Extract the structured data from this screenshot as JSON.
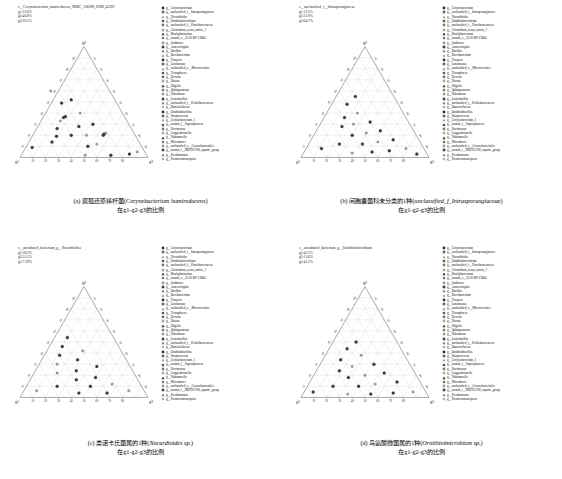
{
  "figure": {
    "axis_labels": {
      "top": "g2",
      "left": "g1",
      "right": "g3"
    },
    "ticks": [
      10,
      20,
      30,
      40,
      50,
      60,
      70,
      80,
      90
    ],
    "grid": true
  },
  "genera": [
    "g__Corynebacterium",
    "g__unclassified_f__Intrasporangiaceae",
    "g__Nocardioides",
    "g__Ornithinimicrobium",
    "g__unclassified_f__Flavobacteriaceae",
    "g__Clostridium_sensu_stricto_1",
    "g__Brachybacterium",
    "g__norank_o__JG30-KF-CM45",
    "g__Janibacter",
    "g__Anaerovirgula",
    "g__Bacillus",
    "g__Brevibacterium",
    "g__Truepera",
    "g__Luteimonas",
    "g__unclassified_o__Micrococcales",
    "g__Tetrasphaera",
    "g__Devosia",
    "g__Dietzia",
    "g__Oligella",
    "g__Sphingomonas",
    "g__Halomonas",
    "g__Lactobacillus",
    "g__unclassified_f__Prolixibacteraceae",
    "g__Barnesiellaceae",
    "g__Ornithinibacillus",
    "g__Streptococcus",
    "g__Corynebacterium_1",
    "g__norank_f__Saprospiraceae",
    "g__Parvimonas",
    "g__Guggenheimella",
    "g__Nakamurella",
    "g__Microbacter",
    "g__unclassified_o__Corynebacteriales",
    "g__norank_f__MBTI33-80_aquatic_group",
    "g__Pseudomonas",
    "g__Promicromonospora"
  ],
  "panels": [
    {
      "id": "a",
      "species_label": "s__Corynebacterium_humireducens_NBRC_106098_DSM_45392",
      "stats": [
        "g1:32.6%",
        "g2:46.8%",
        "g3:20.5%"
      ],
      "caption_cn": "(a) 腐殖还原棒杆菌(",
      "caption_sp": "Corynebacterium humireducens",
      "caption_tail": ")",
      "caption_line2": "在g1-g2-g3的比例",
      "points": [
        {
          "g1": 34,
          "g2": 52,
          "g3": 14
        },
        {
          "g1": 43,
          "g2": 49,
          "g3": 8
        },
        {
          "g1": 33,
          "g2": 40,
          "g3": 27
        },
        {
          "g1": 46,
          "g2": 37,
          "g3": 17
        },
        {
          "g1": 48,
          "g2": 36,
          "g3": 16
        },
        {
          "g1": 52,
          "g2": 33,
          "g3": 15
        },
        {
          "g1": 28,
          "g2": 30,
          "g3": 42
        },
        {
          "g1": 40,
          "g2": 28,
          "g3": 32
        },
        {
          "g1": 22,
          "g2": 22,
          "g3": 56
        },
        {
          "g1": 24,
          "g2": 21,
          "g3": 55
        },
        {
          "g1": 25,
          "g2": 20,
          "g3": 55
        },
        {
          "g1": 38,
          "g2": 20,
          "g3": 42
        },
        {
          "g1": 50,
          "g2": 20,
          "g3": 30
        },
        {
          "g1": 62,
          "g2": 19,
          "g3": 19
        },
        {
          "g1": 34,
          "g2": 12,
          "g3": 54
        },
        {
          "g1": 42,
          "g2": 10,
          "g3": 48
        },
        {
          "g1": 86,
          "g2": 9,
          "g3": 5
        },
        {
          "g1": 6,
          "g2": 5,
          "g3": 89
        },
        {
          "g1": 13,
          "g2": 3,
          "g3": 84
        },
        {
          "g1": 28,
          "g2": 2,
          "g3": 70
        },
        {
          "g1": 48,
          "g2": 2,
          "g3": 50
        },
        {
          "g1": 68,
          "g2": 14,
          "g3": 18
        },
        {
          "g1": 58,
          "g2": 26,
          "g3": 16
        },
        {
          "g1": 46,
          "g2": 60,
          "g3": -6
        }
      ]
    },
    {
      "id": "b",
      "species_label": "s__unclassified_f__Intrasporangiaceae",
      "stats": [
        "g1:13.5%",
        "g2:21.8%",
        "g3:64.7%"
      ],
      "caption_cn": "(b) 间胞囊菌科未分类的1种(",
      "caption_sp": "unclassified_f_Intrasporangiaceae",
      "caption_tail": ")",
      "caption_line2": "在g1-g2-g3的比例",
      "points": [
        {
          "g1": 30,
          "g2": 55,
          "g3": 15
        },
        {
          "g1": 40,
          "g2": 48,
          "g3": 12
        },
        {
          "g1": 36,
          "g2": 40,
          "g3": 24
        },
        {
          "g1": 48,
          "g2": 36,
          "g3": 16
        },
        {
          "g1": 30,
          "g2": 32,
          "g3": 38
        },
        {
          "g1": 44,
          "g2": 30,
          "g3": 26
        },
        {
          "g1": 54,
          "g2": 28,
          "g3": 18
        },
        {
          "g1": 26,
          "g2": 24,
          "g3": 50
        },
        {
          "g1": 38,
          "g2": 22,
          "g3": 40
        },
        {
          "g1": 50,
          "g2": 20,
          "g3": 30
        },
        {
          "g1": 20,
          "g2": 16,
          "g3": 64
        },
        {
          "g1": 33,
          "g2": 14,
          "g3": 53
        },
        {
          "g1": 46,
          "g2": 12,
          "g3": 42
        },
        {
          "g1": 64,
          "g2": 12,
          "g3": 24
        },
        {
          "g1": 14,
          "g2": 8,
          "g3": 78
        },
        {
          "g1": 28,
          "g2": 6,
          "g3": 66
        },
        {
          "g1": 42,
          "g2": 5,
          "g3": 53
        },
        {
          "g1": 58,
          "g2": 4,
          "g3": 38
        },
        {
          "g1": 80,
          "g2": 8,
          "g3": 12
        },
        {
          "g1": 8,
          "g2": 3,
          "g3": 89
        }
      ]
    },
    {
      "id": "c",
      "species_label": "s__uncultured_bacterium_g__Nocardioides",
      "stats": [
        "g1:38.3%",
        "g2:53.1%",
        "g3:7.59%"
      ],
      "caption_cn": "(c) 类诺卡氏菌属的1种(",
      "caption_sp": "Nocardioides sp.",
      "caption_tail": ")",
      "caption_line2": "在g1-g2-g3的比例",
      "points": [
        {
          "g1": 36,
          "g2": 54,
          "g3": 10
        },
        {
          "g1": 44,
          "g2": 46,
          "g3": 10
        },
        {
          "g1": 30,
          "g2": 42,
          "g3": 28
        },
        {
          "g1": 50,
          "g2": 38,
          "g3": 12
        },
        {
          "g1": 38,
          "g2": 34,
          "g3": 28
        },
        {
          "g1": 56,
          "g2": 30,
          "g3": 14
        },
        {
          "g1": 26,
          "g2": 28,
          "g3": 46
        },
        {
          "g1": 44,
          "g2": 24,
          "g3": 32
        },
        {
          "g1": 60,
          "g2": 22,
          "g3": 18
        },
        {
          "g1": 32,
          "g2": 18,
          "g3": 50
        },
        {
          "g1": 48,
          "g2": 16,
          "g3": 36
        },
        {
          "g1": 22,
          "g2": 12,
          "g3": 66
        },
        {
          "g1": 40,
          "g2": 10,
          "g3": 50
        },
        {
          "g1": 66,
          "g2": 10,
          "g3": 24
        },
        {
          "g1": 12,
          "g2": 6,
          "g3": 82
        },
        {
          "g1": 30,
          "g2": 4,
          "g3": 66
        },
        {
          "g1": 52,
          "g2": 4,
          "g3": 44
        },
        {
          "g1": 84,
          "g2": 6,
          "g3": 10
        }
      ]
    },
    {
      "id": "d",
      "species_label": "s__uncultured_bacterium_g__Ornithinimicrobium",
      "stats": [
        "g1:43.2%",
        "g2:15.6%",
        "g3:41.2%"
      ],
      "caption_cn": "(d) 鸟氨酸微菌属的1种(",
      "caption_sp": "Ornithinimicrobium sp.",
      "caption_tail": ")",
      "caption_line2": "在g1-g2-g3的比例",
      "points": [
        {
          "g1": 32,
          "g2": 50,
          "g3": 18
        },
        {
          "g1": 42,
          "g2": 44,
          "g3": 14
        },
        {
          "g1": 34,
          "g2": 38,
          "g3": 28
        },
        {
          "g1": 52,
          "g2": 34,
          "g3": 14
        },
        {
          "g1": 28,
          "g2": 30,
          "g3": 42
        },
        {
          "g1": 46,
          "g2": 28,
          "g3": 26
        },
        {
          "g1": 58,
          "g2": 24,
          "g3": 18
        },
        {
          "g1": 24,
          "g2": 22,
          "g3": 54
        },
        {
          "g1": 40,
          "g2": 20,
          "g3": 40
        },
        {
          "g1": 54,
          "g2": 18,
          "g3": 28
        },
        {
          "g1": 18,
          "g2": 14,
          "g3": 68
        },
        {
          "g1": 36,
          "g2": 12,
          "g3": 52
        },
        {
          "g1": 50,
          "g2": 10,
          "g3": 40
        },
        {
          "g1": 70,
          "g2": 10,
          "g3": 20
        },
        {
          "g1": 10,
          "g2": 5,
          "g3": 85
        },
        {
          "g1": 26,
          "g2": 4,
          "g3": 70
        },
        {
          "g1": 44,
          "g2": 3,
          "g3": 53
        },
        {
          "g1": 62,
          "g2": 3,
          "g3": 35
        },
        {
          "g1": 88,
          "g2": 5,
          "g3": 7
        }
      ]
    }
  ],
  "chart_data": {
    "type": "scatter",
    "subtype": "ternary",
    "title": "",
    "axes": {
      "a": "g1",
      "b": "g2",
      "c": "g3"
    },
    "axis_range": [
      0,
      100
    ],
    "tick_labels": [
      10,
      20,
      30,
      40,
      50,
      60,
      70,
      80,
      90
    ],
    "legend_position": "right",
    "grid": true,
    "panels": [
      "a",
      "b",
      "c",
      "d"
    ]
  }
}
